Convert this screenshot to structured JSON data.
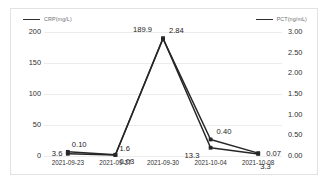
{
  "chart_data": {
    "type": "line",
    "title": "",
    "xlabel": "",
    "categories": [
      "2021-09-23",
      "2021-09-27",
      "2021-09-30",
      "2021-10-04",
      "2021-10-08"
    ],
    "grid": true,
    "legend_position": "top",
    "series": [
      {
        "name": "CRP(mg/L)",
        "axis": "left",
        "ylabel": "CRP(mg/L)",
        "ylim": [
          0,
          200
        ],
        "yticks": [
          "0",
          "50",
          "100",
          "150",
          "200"
        ],
        "ytick_values": [
          0,
          50,
          100,
          150,
          200
        ],
        "values": [
          3.6,
          1.6,
          189.9,
          13.3,
          3.3
        ],
        "value_labels": [
          "3.6",
          "1.6",
          "189.9",
          "13.3",
          "3.3"
        ],
        "color": "#262626",
        "marker": "square"
      },
      {
        "name": "PCT(ng/mL)",
        "axis": "right",
        "ylabel": "PCT(ng/mL)",
        "ylim": [
          0,
          3.0
        ],
        "yticks": [
          "0.00",
          "0.50",
          "1.00",
          "1.50",
          "2.00",
          "2.50",
          "3.00"
        ],
        "ytick_values": [
          0,
          0.5,
          1.0,
          1.5,
          2.0,
          2.5,
          3.0
        ],
        "values": [
          0.1,
          0.03,
          2.84,
          0.4,
          0.07
        ],
        "value_labels": [
          "0.10",
          "0.03",
          "2.84",
          "0.40",
          "0.07"
        ],
        "color": "#262626",
        "marker": "square"
      }
    ]
  },
  "legend": {
    "crp": "CRP(mg/L)",
    "pct": "PCT(ng/mL)"
  },
  "axis_left": {
    "ticks": [
      "200",
      "150",
      "100",
      "50",
      "0"
    ]
  },
  "axis_right": {
    "ticks": [
      "3.00",
      "2.50",
      "2.00",
      "1.50",
      "1.00",
      "0.50",
      "0.00"
    ]
  },
  "x_axis": {
    "ticks": [
      "2021-09-23",
      "2021-09-27",
      "2021-09-30",
      "2021-10-04",
      "2021-10-08"
    ]
  },
  "data_labels": {
    "crp": [
      "3.6",
      "1.6",
      "189.9",
      "13.3",
      "3.3"
    ],
    "pct": [
      "0.10",
      "0.03",
      "2.84",
      "0.40",
      "0.07"
    ]
  },
  "colors": {
    "line": "#262626",
    "grid": "#ececec",
    "border": "#e2e2e2",
    "text": "#2f2f2f",
    "legend_text": "#6d6d6d"
  }
}
